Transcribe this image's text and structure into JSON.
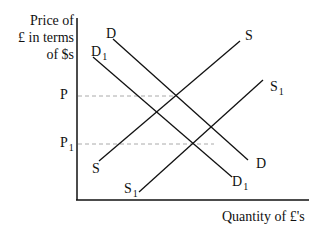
{
  "diagram": {
    "type": "supply-demand",
    "y_axis_title_lines": [
      "Price of",
      "£ in terms",
      "of $s"
    ],
    "x_axis_title": "Quantity of £'s",
    "price_levels": [
      {
        "label": "P",
        "subscript": ""
      },
      {
        "label": "P",
        "subscript": "1"
      }
    ],
    "curves": [
      {
        "id": "S",
        "label": "S",
        "subscript": "",
        "kind": "supply",
        "start_label": "S",
        "end_label": "S"
      },
      {
        "id": "S1",
        "label": "S",
        "subscript": "1",
        "kind": "supply",
        "start_label": "S1",
        "end_label": "S1"
      },
      {
        "id": "D",
        "label": "D",
        "subscript": "",
        "kind": "demand",
        "start_label": "D",
        "end_label": "D"
      },
      {
        "id": "D1",
        "label": "D",
        "subscript": "1",
        "kind": "demand",
        "start_label": "D1",
        "end_label": "D1"
      }
    ],
    "colors": {
      "line": "#111111",
      "dashed": "#aaaaaa",
      "background": "#ffffff"
    }
  }
}
